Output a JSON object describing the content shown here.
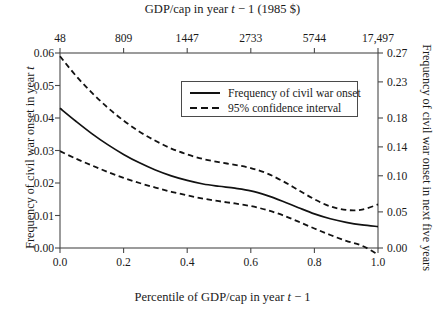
{
  "chart_data": {
    "type": "line",
    "title": "GDP/cap in year t − 1 (1985 $)",
    "xlabel": "Percentile of GDP/cap in year t − 1",
    "ylabel": "Frequency of civil war onset in year t",
    "y2label": "Frequency of civil war onset in next five years",
    "xlim": [
      0.0,
      1.0
    ],
    "ylim": [
      0.0,
      0.06
    ],
    "y2lim": [
      0.0,
      0.27
    ],
    "grid": false,
    "legend_position": "top-right-inside",
    "x_ticks": [
      "0.0",
      "0.2",
      "0.4",
      "0.6",
      "0.8",
      "1.0"
    ],
    "x_tick_values": [
      0.0,
      0.2,
      0.4,
      0.6,
      0.8,
      1.0
    ],
    "y_ticks": [
      "0.00",
      "0.01",
      "0.02",
      "0.03",
      "0.04",
      "0.05",
      "0.06"
    ],
    "y_tick_values": [
      0.0,
      0.01,
      0.02,
      0.03,
      0.04,
      0.05,
      0.06
    ],
    "y2_ticks": [
      "0.00",
      "0.05",
      "0.10",
      "0.14",
      "0.18",
      "0.23",
      "0.27"
    ],
    "y2_tick_values": [
      0.0,
      0.05,
      0.1,
      0.14,
      0.18,
      0.23,
      0.27
    ],
    "top_axis_ticks": [
      "48",
      "809",
      "1447",
      "2733",
      "5744",
      "17,497"
    ],
    "top_axis_tick_values": [
      0.0,
      0.2,
      0.4,
      0.6,
      0.8,
      1.0
    ],
    "x": [
      0.0,
      0.05,
      0.1,
      0.15,
      0.2,
      0.25,
      0.3,
      0.35,
      0.4,
      0.45,
      0.5,
      0.55,
      0.6,
      0.65,
      0.7,
      0.75,
      0.8,
      0.85,
      0.9,
      0.95,
      1.0
    ],
    "series": [
      {
        "name": "Frequency of civil war onset",
        "style": "solid",
        "values": [
          0.043,
          0.039,
          0.0352,
          0.0318,
          0.0288,
          0.0262,
          0.024,
          0.0222,
          0.0208,
          0.0197,
          0.019,
          0.0184,
          0.0176,
          0.0162,
          0.0144,
          0.0124,
          0.0105,
          0.009,
          0.0079,
          0.0071,
          0.0066
        ]
      },
      {
        "name": "95% confidence interval upper",
        "style": "dashed",
        "values": [
          0.059,
          0.053,
          0.0478,
          0.0432,
          0.0392,
          0.0358,
          0.033,
          0.0306,
          0.0288,
          0.0274,
          0.0264,
          0.0256,
          0.0246,
          0.023,
          0.0206,
          0.0178,
          0.015,
          0.0128,
          0.0117,
          0.0118,
          0.0134
        ]
      },
      {
        "name": "95% confidence interval lower",
        "style": "dashed",
        "values": [
          0.0298,
          0.0275,
          0.0254,
          0.0234,
          0.0216,
          0.02,
          0.0186,
          0.0173,
          0.0162,
          0.0152,
          0.0144,
          0.0137,
          0.0129,
          0.0117,
          0.0101,
          0.0081,
          0.006,
          0.004,
          0.0022,
          0.0007,
          -0.002
        ]
      }
    ],
    "legend": [
      {
        "label": "Frequency of civil war onset",
        "style": "solid"
      },
      {
        "label": "95% confidence interval",
        "style": "dashed"
      }
    ],
    "colors": {
      "line": "#121212",
      "axis": "#4a4a4a",
      "text": "#1a1a1a",
      "background": "#ffffff"
    }
  }
}
